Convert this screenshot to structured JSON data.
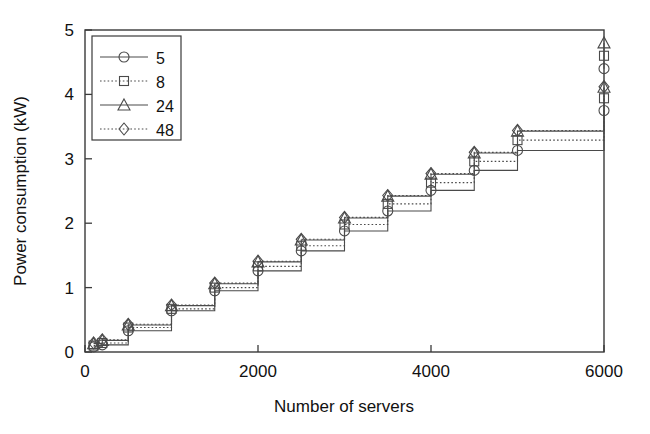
{
  "chart_data": {
    "type": "line",
    "title": "",
    "xlabel": "Number of servers",
    "ylabel": "Power consumption (kW)",
    "xlim": [
      0,
      6000
    ],
    "ylim": [
      0,
      5
    ],
    "xticks": [
      0,
      2000,
      4000,
      6000
    ],
    "xtick_labels": [
      "0",
      "2000",
      "4000",
      "6000"
    ],
    "yticks": [
      0,
      1,
      2,
      3,
      4,
      5
    ],
    "ytick_labels": [
      "0",
      "1",
      "2",
      "3",
      "4",
      "5"
    ],
    "grid": false,
    "legend_position": "upper left",
    "legend_title": "",
    "drawstyle": "steps-post",
    "x": [
      100,
      200,
      500,
      1000,
      1500,
      2000,
      2500,
      3000,
      3500,
      4000,
      4500,
      5000,
      6000
    ],
    "series": [
      {
        "name": "5",
        "label": "5",
        "marker": "circle",
        "linestyle": "solid",
        "color": "#4a4a4a",
        "values": [
          0.08,
          0.11,
          0.33,
          0.64,
          0.95,
          1.26,
          1.57,
          1.88,
          2.19,
          2.51,
          2.82,
          3.13,
          3.75
        ]
      },
      {
        "name": "8",
        "label": "8",
        "marker": "square",
        "linestyle": "dotted",
        "color": "#4a4a4a",
        "values": [
          0.1,
          0.14,
          0.38,
          0.67,
          1.0,
          1.33,
          1.65,
          1.98,
          2.3,
          2.63,
          2.96,
          3.29,
          3.94
        ]
      },
      {
        "name": "24",
        "label": "24",
        "marker": "triangle",
        "linestyle": "solid",
        "color": "#4a4a4a",
        "values": [
          0.13,
          0.18,
          0.42,
          0.72,
          1.06,
          1.4,
          1.74,
          2.08,
          2.42,
          2.76,
          3.09,
          3.43,
          4.11
        ]
      },
      {
        "name": "48",
        "label": "48",
        "marker": "diamond",
        "linestyle": "dotted",
        "color": "#4a4a4a",
        "values": [
          0.14,
          0.19,
          0.43,
          0.73,
          1.07,
          1.41,
          1.75,
          2.09,
          2.43,
          2.77,
          3.1,
          3.44,
          4.12
        ]
      }
    ],
    "top_cluster_x6000": {
      "description": "At x=6000 an additional vertical riser shows upper marker set",
      "values": [
        4.4,
        4.6,
        4.8
      ]
    }
  }
}
